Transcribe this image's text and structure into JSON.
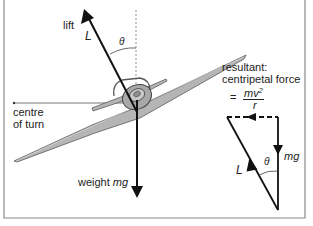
{
  "labels": {
    "lift": "lift",
    "lift_symbol": "L",
    "theta_top": "θ",
    "centre_of_turn_line1": "centre",
    "centre_of_turn_line2": "of turn",
    "weight_word": "weight",
    "weight_symbol": "mg",
    "resultant_line1": "resultant:",
    "resultant_line2": "centripetal force",
    "equals": "=",
    "numerator": "mv",
    "numerator_exp": "2",
    "denominator": "r",
    "triangle_mg": "mg",
    "triangle_L": "L",
    "triangle_theta": "θ"
  },
  "colors": {
    "vector": "#111111",
    "plane_fill": "#b8b8b8",
    "plane_stroke": "#555555",
    "frame": "#888888",
    "guide": "#777777"
  }
}
